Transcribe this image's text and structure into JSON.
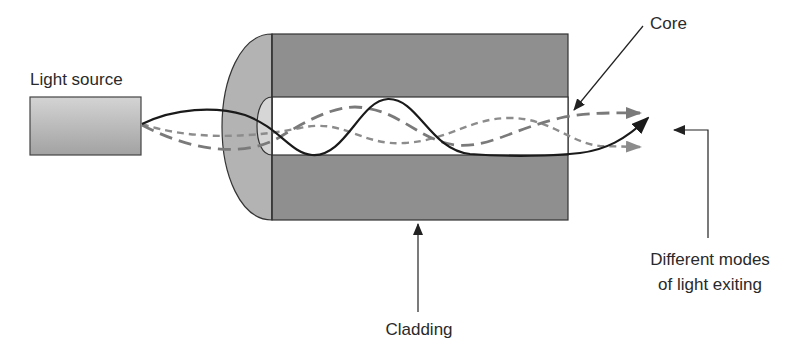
{
  "diagram": {
    "labels": {
      "light_source": "Light source",
      "core": "Core",
      "cladding": "Cladding",
      "exit_line1": "Different modes",
      "exit_line2": "of light exiting"
    },
    "components": [
      {
        "id": "light-source",
        "label": "Light source",
        "shape": "rectangle",
        "fill": "#b8b8b8"
      },
      {
        "id": "cladding",
        "label": "Cladding",
        "shape": "rectangle-with-rounded-end",
        "fill": "#8f8f8f",
        "end_fill": "#b3b3b3"
      },
      {
        "id": "core",
        "label": "Core",
        "shape": "rectangle",
        "fill": "#ffffff"
      }
    ],
    "rays": [
      {
        "id": "mode-solid",
        "style": "solid",
        "color": "#1a1a1a"
      },
      {
        "id": "mode-long-dash",
        "style": "long-dash",
        "color": "#7a7a7a"
      },
      {
        "id": "mode-short-dash",
        "style": "short-dash",
        "color": "#8c8c8c"
      }
    ],
    "colors": {
      "outline": "#333333",
      "cladding": "#8f8f8f",
      "cladding_end": "#b3b3b3",
      "source_top": "#d0d0d0",
      "source_bottom": "#a0a0a0",
      "text": "#2a2a2a"
    }
  }
}
